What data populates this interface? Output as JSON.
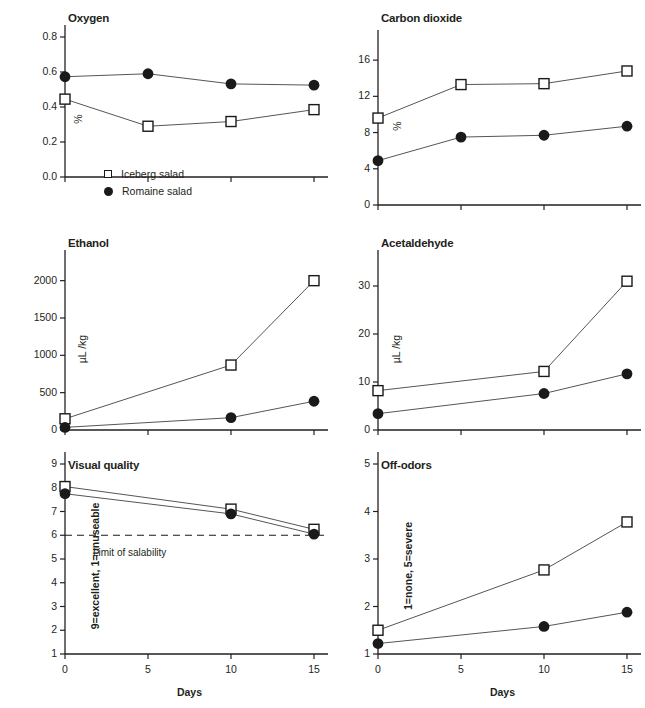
{
  "figure": {
    "xlabel": "Days",
    "x_ticks": [
      0,
      5,
      10,
      15
    ],
    "series_names": [
      "Iceberg salad",
      "Romaine salad"
    ],
    "legend": {
      "iceberg": "Iceberg salad",
      "romaine": "Romaine salad",
      "iceberg_marker": "open-square",
      "romaine_marker": "filled-circle"
    },
    "colors": {
      "ink": "#231f20",
      "line": "#555555",
      "marker_edge": "#1a1a1a",
      "marker_fill_open": "#ffffff",
      "marker_fill_closed": "#1a1a1a"
    }
  },
  "chart_data": [
    {
      "type": "line",
      "title": "Oxygen",
      "xlabel": "",
      "ylabel": "%",
      "x": [
        0,
        5,
        10,
        15
      ],
      "xlim": [
        0,
        15
      ],
      "ylim": [
        0.0,
        0.8
      ],
      "yticks": [
        0.0,
        0.2,
        0.4,
        0.6,
        0.8
      ],
      "ytick_labels": [
        "0.0",
        "0.2",
        "0.4",
        "0.6",
        "0.8"
      ],
      "grid": false,
      "legend_position": "lower-left-inside",
      "series": [
        {
          "name": "Iceberg salad",
          "marker": "open-square",
          "values": [
            0.445,
            0.29,
            0.317,
            0.385
          ]
        },
        {
          "name": "Romaine salad",
          "marker": "filled-circle",
          "values": [
            0.573,
            0.59,
            0.532,
            0.525
          ]
        }
      ]
    },
    {
      "type": "line",
      "title": "Carbon dioxide",
      "xlabel": "",
      "ylabel": "%",
      "x": [
        0,
        5,
        10,
        15
      ],
      "xlim": [
        0,
        15
      ],
      "ylim": [
        0,
        18
      ],
      "yticks": [
        0,
        4,
        8,
        12,
        16
      ],
      "ytick_labels": [
        "0",
        "4",
        "8",
        "12",
        "16"
      ],
      "grid": false,
      "series": [
        {
          "name": "Iceberg salad",
          "marker": "open-square",
          "values": [
            9.6,
            13.3,
            13.4,
            14.8
          ]
        },
        {
          "name": "Romaine salad",
          "marker": "filled-circle",
          "values": [
            4.9,
            7.5,
            7.7,
            8.7
          ]
        }
      ]
    },
    {
      "type": "line",
      "title": "Ethanol",
      "xlabel": "",
      "ylabel": "µL /kg",
      "x": [
        0,
        5,
        10,
        15
      ],
      "xlim": [
        0,
        15
      ],
      "ylim": [
        0,
        2250
      ],
      "yticks": [
        0,
        500,
        1000,
        1500,
        2000
      ],
      "ytick_labels": [
        "0",
        "500",
        "1000",
        "1500",
        "2000"
      ],
      "grid": false,
      "series": [
        {
          "name": "Iceberg salad",
          "marker": "open-square",
          "values": [
            150,
            null,
            870,
            2000
          ]
        },
        {
          "name": "Romaine salad",
          "marker": "filled-circle",
          "values": [
            35,
            null,
            165,
            385
          ]
        }
      ]
    },
    {
      "type": "line",
      "title": "Acetaldehyde",
      "xlabel": "",
      "ylabel": "µL /kg",
      "x": [
        0,
        5,
        10,
        15
      ],
      "xlim": [
        0,
        15
      ],
      "ylim": [
        0,
        35
      ],
      "yticks": [
        0,
        10,
        20,
        30
      ],
      "ytick_labels": [
        "0",
        "10",
        "20",
        "30"
      ],
      "grid": false,
      "series": [
        {
          "name": "Iceberg salad",
          "marker": "open-square",
          "values": [
            8.2,
            null,
            12.2,
            31.0
          ]
        },
        {
          "name": "Romaine salad",
          "marker": "filled-circle",
          "values": [
            3.4,
            null,
            7.6,
            11.7
          ]
        }
      ]
    },
    {
      "type": "line",
      "title": "Visual quality",
      "xlabel": "Days",
      "ylabel": "9=excellent, 1=unuseable",
      "x": [
        0,
        5,
        10,
        15
      ],
      "xlim": [
        0,
        15
      ],
      "ylim": [
        1,
        9
      ],
      "yticks": [
        1,
        2,
        3,
        4,
        5,
        6,
        7,
        8,
        9
      ],
      "ytick_labels": [
        "1",
        "2",
        "3",
        "4",
        "5",
        "6",
        "7",
        "8",
        "9"
      ],
      "grid": false,
      "annotation": {
        "text": "Limit of salability",
        "y": 6,
        "style": "dashed-hline"
      },
      "series": [
        {
          "name": "Iceberg salad",
          "marker": "open-square",
          "values": [
            8.05,
            null,
            7.1,
            6.25
          ]
        },
        {
          "name": "Romaine salad",
          "marker": "filled-circle",
          "values": [
            7.75,
            null,
            6.9,
            6.05
          ]
        }
      ]
    },
    {
      "type": "line",
      "title": "Off-odors",
      "xlabel": "Days",
      "ylabel": "1=none, 5=severe",
      "x": [
        0,
        5,
        10,
        15
      ],
      "xlim": [
        0,
        15
      ],
      "ylim": [
        1,
        5
      ],
      "yticks": [
        1,
        2,
        3,
        4,
        5
      ],
      "ytick_labels": [
        "1",
        "2",
        "3",
        "4",
        "5"
      ],
      "grid": false,
      "series": [
        {
          "name": "Iceberg salad",
          "marker": "open-square",
          "values": [
            1.5,
            null,
            2.77,
            3.78
          ]
        },
        {
          "name": "Romaine salad",
          "marker": "filled-circle",
          "values": [
            1.22,
            null,
            1.58,
            1.88
          ]
        }
      ]
    }
  ]
}
